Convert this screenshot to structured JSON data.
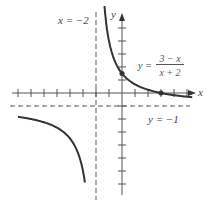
{
  "chart_data": {
    "type": "line",
    "function": "y = (3 - x)/(x + 2)",
    "labels": {
      "x_axis": "x",
      "y_axis": "y",
      "vertical_asymptote": "x = −2",
      "horizontal_asymptote": "y = −1",
      "equation_prefix": "y =",
      "equation_numerator": "3 − x",
      "equation_denominator": "x + 2"
    },
    "asymptotes": {
      "vertical": -2,
      "horizontal": -1
    },
    "marked_points": [
      {
        "x": 0,
        "y": 1.5
      },
      {
        "x": 3,
        "y": 0
      }
    ],
    "xlim": [
      -6,
      6.5
    ],
    "ylim": [
      -6.5,
      6
    ],
    "grid": false
  }
}
